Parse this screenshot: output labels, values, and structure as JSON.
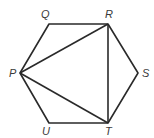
{
  "figure": {
    "type": "regular-hexagon-with-diagonals",
    "stroke_color": "#2a2a2a",
    "label_color": "#3a3a3a",
    "vertices": {
      "P": {
        "label": "P",
        "x": 20,
        "y": 73,
        "lx": 9,
        "ly": 77
      },
      "Q": {
        "label": "Q",
        "x": 49,
        "y": 24,
        "lx": 41,
        "ly": 18
      },
      "R": {
        "label": "R",
        "x": 108,
        "y": 24,
        "lx": 105,
        "ly": 18
      },
      "S": {
        "label": "S",
        "x": 138,
        "y": 73,
        "lx": 142,
        "ly": 77
      },
      "T": {
        "label": "T",
        "x": 108,
        "y": 123,
        "lx": 105,
        "ly": 135
      },
      "U": {
        "label": "U",
        "x": 49,
        "y": 123,
        "lx": 42,
        "ly": 135
      }
    },
    "hexagon_order": [
      "P",
      "Q",
      "R",
      "S",
      "T",
      "U"
    ],
    "diagonals": [
      [
        "P",
        "R"
      ],
      [
        "P",
        "T"
      ],
      [
        "R",
        "T"
      ]
    ]
  }
}
